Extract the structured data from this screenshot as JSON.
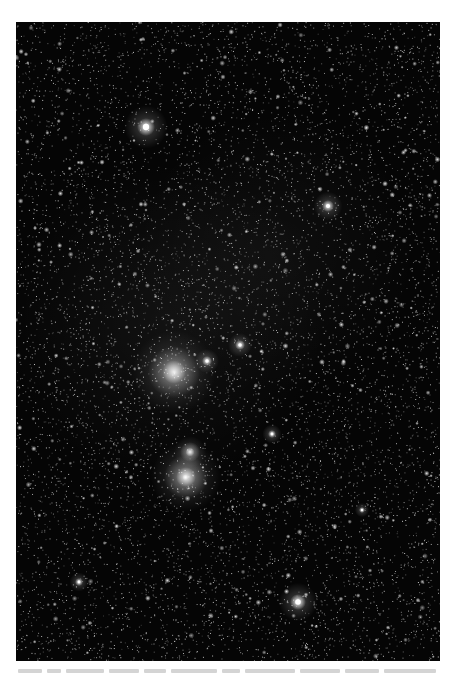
{
  "photo": {
    "subject": "Orion constellation star field",
    "background_color": "#050505",
    "bright_stars": [
      {
        "label": "upper-left bright star",
        "x": 130,
        "y": 105,
        "size": 9
      },
      {
        "label": "upper-right bright star",
        "x": 312,
        "y": 184,
        "size": 6
      },
      {
        "label": "belt star left",
        "x": 191,
        "y": 339,
        "size": 5
      },
      {
        "label": "belt star right",
        "x": 224,
        "y": 323,
        "size": 5
      },
      {
        "label": "center star",
        "x": 256,
        "y": 412,
        "size": 4
      },
      {
        "label": "lower-right bright star",
        "x": 282,
        "y": 580,
        "size": 8
      },
      {
        "label": "left edge star",
        "x": 63,
        "y": 560,
        "size": 4
      },
      {
        "label": "right star",
        "x": 346,
        "y": 488,
        "size": 3
      }
    ],
    "nebulae": [
      {
        "label": "nebula cluster upper",
        "x": 158,
        "y": 350,
        "r": 26
      },
      {
        "label": "bright nebula lower",
        "x": 170,
        "y": 455,
        "r": 22
      },
      {
        "label": "nebula knot above",
        "x": 174,
        "y": 430,
        "r": 10
      }
    ]
  },
  "caption": {
    "text_visible": false,
    "segment_widths": [
      24,
      14,
      38,
      30,
      22,
      46,
      18,
      50,
      40,
      34,
      52
    ]
  }
}
